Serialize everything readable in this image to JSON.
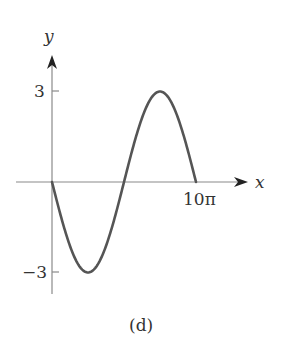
{
  "chart_data": {
    "type": "line",
    "title": "",
    "caption": "(d)",
    "xlabel": "x",
    "ylabel": "y",
    "xticks": [
      "10π"
    ],
    "yticks": [
      "3",
      "-3"
    ],
    "xlim": [
      0,
      31.4159
    ],
    "ylim": [
      -3,
      3
    ],
    "grid": false,
    "legend": null,
    "function": "y = -3 sin(x/5)",
    "series": [
      {
        "name": "curve",
        "x": [
          0,
          7.854,
          15.708,
          23.562,
          31.416
        ],
        "y": [
          0,
          -3,
          0,
          3,
          0
        ]
      }
    ],
    "colors": {
      "curve": "#555555",
      "axes": "#888888"
    }
  },
  "labels": {
    "y_axis": "y",
    "x_axis": "x",
    "tick_3": "3",
    "tick_neg3": "−3",
    "tick_10pi": "10π",
    "caption": "(d)"
  }
}
